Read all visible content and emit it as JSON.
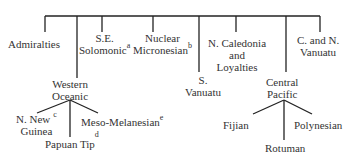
{
  "tree": {
    "root_children": [
      {
        "label": "Admiralties"
      },
      {
        "label_lines": [
          "Western",
          "Oceanic"
        ],
        "children": [
          {
            "label_lines": [
              "N. New",
              "Guinea"
            ],
            "note": "c"
          },
          {
            "label": "Papuan Tip",
            "note": "d"
          },
          {
            "label": "Meso-Melanesian",
            "note": "e"
          }
        ]
      },
      {
        "label_lines": [
          "S.E.",
          "Solomonic"
        ],
        "note": "a"
      },
      {
        "label_lines": [
          "Nuclear",
          "Micronesian"
        ],
        "note": "b"
      },
      {
        "label_lines": [
          "S.",
          "Vanuatu"
        ]
      },
      {
        "label_lines": [
          "N. Caledonia",
          "and",
          "Loyalties"
        ]
      },
      {
        "label_lines": [
          "Central",
          "Pacific"
        ],
        "children": [
          {
            "label": "Fijian"
          },
          {
            "label": "Rotuman"
          },
          {
            "label": "Polynesian"
          }
        ]
      },
      {
        "label_lines": [
          "C. and N.",
          "Vanuatu"
        ]
      }
    ]
  },
  "labels": {
    "admiralties": "Admiralties",
    "se1": "S.E.",
    "se2": "Solomonic",
    "se_note": "a",
    "nuc1": "Nuclear",
    "nuc2": "Micronesian",
    "nuc_note": "b",
    "ncal1": "N. Caledonia",
    "ncal2": "and",
    "ncal3": "Loyalties",
    "cn1": "C. and N.",
    "cn2": "Vanuatu",
    "wo1": "Western",
    "wo2": "Oceanic",
    "sv1": "S.",
    "sv2": "Vanuatu",
    "cp1": "Central",
    "cp2": "Pacific",
    "nng1": "N. New",
    "nng2": "Guinea",
    "nng_note": "c",
    "pt": "Papuan Tip",
    "pt_note": "d",
    "mm": "Meso-Melanesian",
    "mm_note": "e",
    "fijian": "Fijian",
    "rotuman": "Rotuman",
    "polynesian": "Polynesian"
  }
}
